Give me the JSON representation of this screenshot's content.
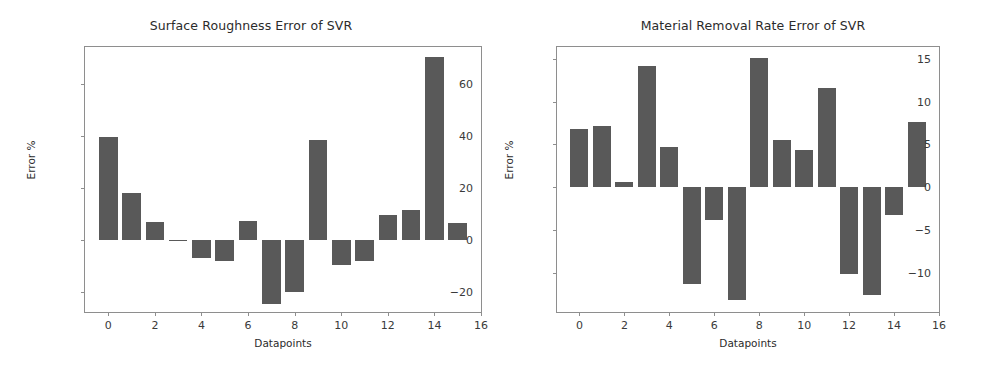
{
  "figure": {
    "background": "#ffffff",
    "bar_color": "#595959",
    "axis_color": "#8e8e8e",
    "text_color": "#2b2b2b"
  },
  "chart_data": [
    {
      "type": "bar",
      "panel": "left",
      "title": "Surface Roughness Error of SVR",
      "xlabel": "Datapoints",
      "ylabel": "Error %",
      "grid": false,
      "legend": null,
      "categories": [
        0,
        1,
        2,
        3,
        4,
        5,
        6,
        7,
        8,
        9,
        10,
        11,
        12,
        13,
        14,
        15
      ],
      "values": [
        39.5,
        18.0,
        7.0,
        0.2,
        -7.0,
        -8.0,
        7.5,
        -24.5,
        -20.0,
        38.5,
        -9.5,
        -8.0,
        9.5,
        11.5,
        70.0,
        6.5
      ],
      "xlim": [
        -1,
        16
      ],
      "ylim": [
        -27.5,
        74.0
      ],
      "xticks": [
        0,
        2,
        4,
        6,
        8,
        10,
        12,
        14,
        16
      ],
      "xtick_labels": [
        "0",
        "2",
        "4",
        "6",
        "8",
        "10",
        "12",
        "14",
        "16"
      ],
      "yticks": [
        -20,
        0,
        20,
        40,
        60
      ],
      "ytick_labels": [
        "−20",
        "0",
        "20",
        "40",
        "60"
      ],
      "bar_color": "#595959"
    },
    {
      "type": "bar",
      "panel": "right",
      "title": "Material Removal Rate Error of SVR",
      "xlabel": "Datapoints",
      "ylabel": "Error %",
      "grid": false,
      "legend": null,
      "categories": [
        0,
        1,
        2,
        3,
        4,
        5,
        6,
        7,
        8,
        9,
        10,
        11,
        12,
        13,
        14,
        15
      ],
      "values": [
        6.8,
        7.2,
        0.6,
        14.2,
        4.7,
        -11.3,
        -3.8,
        -13.2,
        15.1,
        5.5,
        4.3,
        11.6,
        -10.2,
        -12.6,
        -3.2,
        7.6
      ],
      "xlim": [
        -1,
        16
      ],
      "ylim": [
        -14.6,
        16.4
      ],
      "xticks": [
        0,
        2,
        4,
        6,
        8,
        10,
        12,
        14,
        16
      ],
      "xtick_labels": [
        "0",
        "2",
        "4",
        "6",
        "8",
        "10",
        "12",
        "14",
        "16"
      ],
      "yticks": [
        -10,
        -5,
        0,
        5,
        10,
        15
      ],
      "ytick_labels": [
        "−10",
        "−5",
        "0",
        "5",
        "10",
        "15"
      ],
      "bar_color": "#595959"
    }
  ]
}
